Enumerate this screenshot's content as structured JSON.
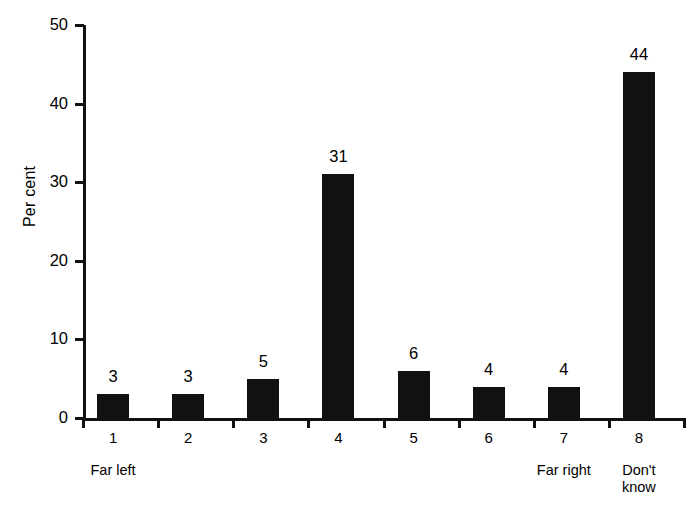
{
  "chart_data": {
    "type": "bar",
    "title": "",
    "subtitle": "",
    "xlabel": "",
    "ylabel": "Per cent",
    "categories": [
      "1",
      "2",
      "3",
      "4",
      "5",
      "6",
      "7",
      "8"
    ],
    "values": [
      3,
      3,
      5,
      31,
      6,
      4,
      4,
      44
    ],
    "value_labels": [
      "3",
      "3",
      "5",
      "31",
      "6",
      "4",
      "4",
      "44"
    ],
    "category_sublabels": [
      "Far left",
      "",
      "",
      "",
      "",
      "",
      "Far right",
      "Don't\nknow"
    ],
    "ylim": [
      0,
      50
    ],
    "y_ticks": [
      0,
      10,
      20,
      30,
      40,
      50
    ],
    "y_tick_labels": [
      "0",
      "10",
      "20",
      "30",
      "40",
      "50"
    ],
    "grid": false,
    "legend": false,
    "legend_position": "none",
    "bar_color": "#111111",
    "axis_color": "#111111",
    "background_color": "#ffffff",
    "show_value_labels": true
  }
}
